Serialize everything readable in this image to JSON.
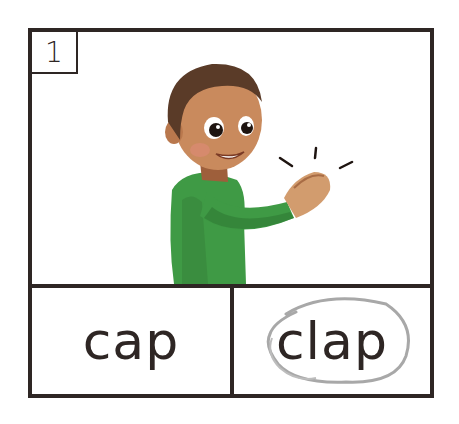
{
  "card": {
    "number": "1",
    "picture": {
      "description": "boy in green shirt clapping hands",
      "shirt_color": "#3f9a45",
      "skin_color": "#c98a5d",
      "hair_color": "#5a3b28"
    },
    "choices": [
      {
        "label": "cap",
        "circled": false
      },
      {
        "label": "clap",
        "circled": true
      }
    ],
    "colors": {
      "border": "#2e2624",
      "circle_mark": "#a8a8a8"
    }
  }
}
